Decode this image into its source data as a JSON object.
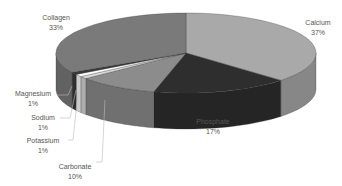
{
  "chart_data": {
    "type": "pie",
    "title": "",
    "style": "3d-exploded-none, grayscale",
    "categories": [
      "Calcium",
      "Phosphate",
      "Carbonate",
      "Potassium",
      "Sodium",
      "Magnesium",
      "Collagen"
    ],
    "values": [
      37,
      17,
      10,
      1,
      1,
      1,
      33
    ],
    "unit": "%",
    "colors": [
      "#a9a9a9",
      "#2e2e2e",
      "#8c8c8c",
      "#d8d8d8",
      "#ffffff",
      "#3a3a3a",
      "#7a7a7a"
    ],
    "labels": [
      {
        "name": "Calcium",
        "pct": "37%",
        "x": 318,
        "y": 18
      },
      {
        "name": "Phosphate",
        "pct": "17%",
        "x": 213,
        "y": 117
      },
      {
        "name": "Carbonate",
        "pct": "10%",
        "x": 75,
        "y": 162
      },
      {
        "name": "Potassium",
        "pct": "1%",
        "x": 43,
        "y": 136
      },
      {
        "name": "Sodium",
        "pct": "1%",
        "x": 43,
        "y": 113
      },
      {
        "name": "Magnesium",
        "pct": "1%",
        "x": 33,
        "y": 89
      },
      {
        "name": "Collagen",
        "pct": "33%",
        "x": 56,
        "y": 13
      }
    ],
    "legend": "none (data labels with leader lines)"
  }
}
